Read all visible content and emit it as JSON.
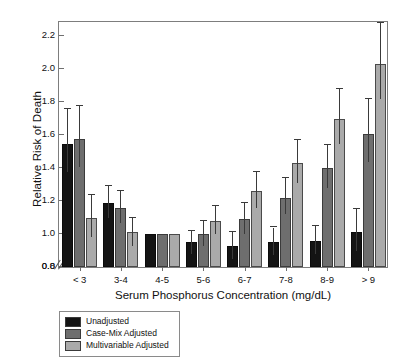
{
  "chart_data": {
    "type": "bar",
    "title": "",
    "xlabel": "Serum Phosphorus Concentration (mg/dL)",
    "ylabel": "Relative Risk of Death",
    "categories": [
      "< 3",
      "3-4",
      "4-5",
      "5-6",
      "6-7",
      "7-8",
      "8-9",
      "> 9"
    ],
    "ylim": [
      0.8,
      2.3
    ],
    "yticks": [
      0.8,
      1.0,
      1.2,
      1.4,
      1.6,
      1.8,
      2.0,
      2.2
    ],
    "ytick_labels": [
      "0.8",
      "1.0",
      "1.2",
      "1.4",
      "1.6",
      "1.8",
      "2.0",
      "2.2"
    ],
    "y_axis_break": true,
    "y_axis_break_label": "0.0",
    "grid": false,
    "legend_position": "below-left",
    "series": [
      {
        "name": "Unadjusted",
        "color": "#141414",
        "values": [
          1.55,
          1.19,
          1.0,
          0.95,
          0.93,
          0.95,
          0.96,
          1.01
        ],
        "err_low": [
          1.38,
          1.1,
          1.0,
          0.88,
          0.85,
          0.87,
          0.88,
          0.9
        ],
        "err_high": [
          1.76,
          1.29,
          1.0,
          1.02,
          1.01,
          1.04,
          1.05,
          1.15
        ]
      },
      {
        "name": "Case-Mix Adjusted",
        "color": "#6e6e6e",
        "values": [
          1.58,
          1.16,
          1.0,
          1.0,
          1.09,
          1.22,
          1.4,
          1.61
        ],
        "err_low": [
          1.41,
          1.07,
          1.0,
          0.93,
          1.0,
          1.12,
          1.28,
          1.44
        ],
        "err_high": [
          1.78,
          1.26,
          1.0,
          1.08,
          1.19,
          1.34,
          1.54,
          1.82
        ]
      },
      {
        "name": "Multivariable Adjusted",
        "color": "#aaaaaa",
        "values": [
          1.1,
          1.01,
          1.0,
          1.08,
          1.26,
          1.43,
          1.7,
          2.03
        ],
        "err_low": [
          0.98,
          0.93,
          1.0,
          1.0,
          1.16,
          1.31,
          1.55,
          1.82
        ],
        "err_high": [
          1.24,
          1.1,
          1.0,
          1.17,
          1.38,
          1.57,
          1.88,
          2.28
        ]
      }
    ]
  }
}
